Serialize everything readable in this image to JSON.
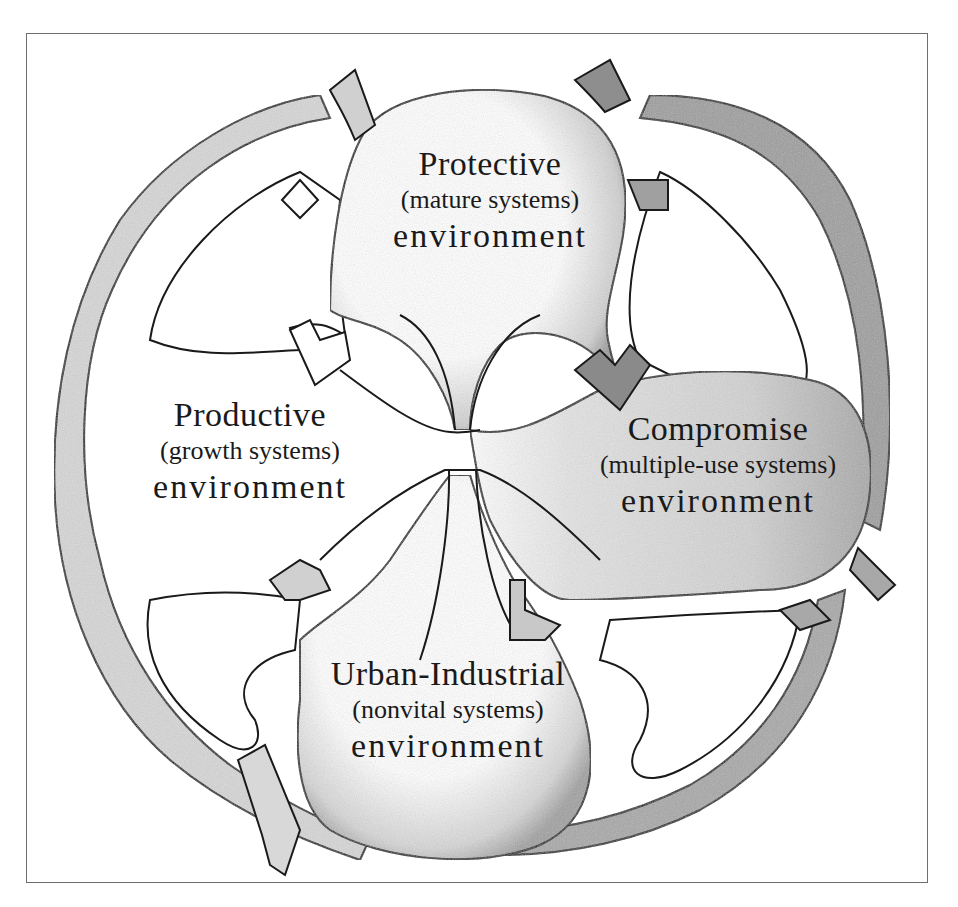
{
  "diagram": {
    "type": "compartment-model",
    "compartments": [
      {
        "id": "protective",
        "title": "Protective",
        "subtitle": "(mature systems)",
        "suffix": "environment",
        "position": "top"
      },
      {
        "id": "productive",
        "title": "Productive",
        "subtitle": "(growth systems)",
        "suffix": "environment",
        "position": "left"
      },
      {
        "id": "compromise",
        "title": "Compromise",
        "subtitle": "(multiple-use systems)",
        "suffix": "environment",
        "position": "right"
      },
      {
        "id": "urban",
        "title": "Urban-Industrial",
        "subtitle": "(nonvital systems)",
        "suffix": "environment",
        "position": "bottom"
      }
    ],
    "colors": {
      "ink": "#1a1a1a",
      "frame": "#6e6e6e",
      "shade_light": "#d9d9d9",
      "shade_mid": "#b5b5b5",
      "shade_dark": "#8c8c8c",
      "paper": "#ffffff"
    }
  }
}
